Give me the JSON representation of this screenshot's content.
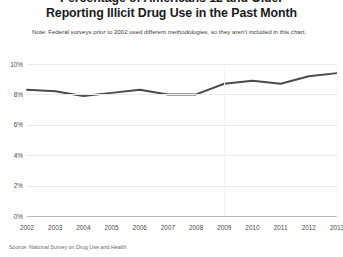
{
  "title": {
    "line1": "Percentage of Americans 12 and Older",
    "line2": "Reporting Illicit Drug Use in the Past Month"
  },
  "note": "Note: Federal surveys prior to 2002 used different methodologies, so they aren't included in this chart.",
  "source": "Source: National Survey on Drug Use and Health",
  "axis": {
    "y_ticks": [
      "10%",
      "8%",
      "6%",
      "4%",
      "2%",
      "0%"
    ],
    "x_ticks": [
      "2002",
      "2003",
      "2004",
      "2005",
      "2006",
      "2007",
      "2008",
      "2009",
      "2010",
      "2011",
      "2012",
      "2013"
    ]
  },
  "colors": {
    "line": "#4a4a4a",
    "grid": "#e9e9e9",
    "axis": "#b9b9b9",
    "text": "#231f20"
  },
  "chart_data": {
    "type": "line",
    "title": "Percentage of Americans 12 and Older Reporting Illicit Drug Use in the Past Month",
    "subtitle": "Note: Federal surveys prior to 2002 used different methodologies, so they aren't included in this chart.",
    "source": "Source: National Survey on Drug Use and Health",
    "xlabel": "",
    "ylabel": "",
    "ylim": [
      0,
      10
    ],
    "yticks": [
      0,
      2,
      4,
      6,
      8,
      10
    ],
    "ytick_labels": [
      "0%",
      "2%",
      "4%",
      "6%",
      "8%",
      "10%"
    ],
    "grid": true,
    "legend": "none",
    "categories": [
      "2002",
      "2003",
      "2004",
      "2005",
      "2006",
      "2007",
      "2008",
      "2009",
      "2010",
      "2011",
      "2012",
      "2013"
    ],
    "x": [
      2002,
      2003,
      2004,
      2005,
      2006,
      2007,
      2008,
      2009,
      2010,
      2011,
      2012,
      2013
    ],
    "values": [
      8.3,
      8.2,
      7.9,
      8.1,
      8.3,
      8.0,
      8.0,
      8.7,
      8.9,
      8.7,
      9.2,
      9.4
    ],
    "unit": "percent",
    "series": [
      {
        "name": "Illicit drug use in past month",
        "values": [
          8.3,
          8.2,
          7.9,
          8.1,
          8.3,
          8.0,
          8.0,
          8.7,
          8.9,
          8.7,
          9.2,
          9.4
        ],
        "color": "#4a4a4a"
      }
    ]
  }
}
